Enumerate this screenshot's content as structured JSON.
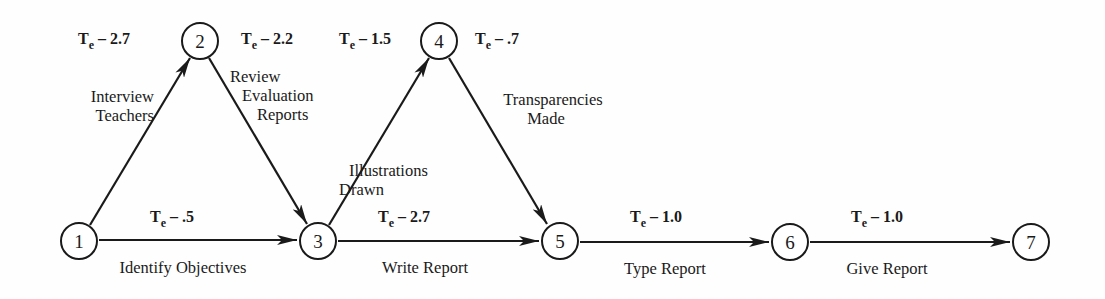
{
  "diagram": {
    "type": "PERT network",
    "nodes": [
      {
        "id": "1",
        "label": "1",
        "x": 79,
        "y": 241
      },
      {
        "id": "2",
        "label": "2",
        "x": 200,
        "y": 41
      },
      {
        "id": "3",
        "label": "3",
        "x": 318,
        "y": 241
      },
      {
        "id": "4",
        "label": "4",
        "x": 439,
        "y": 41
      },
      {
        "id": "5",
        "label": "5",
        "x": 560,
        "y": 241
      },
      {
        "id": "6",
        "label": "6",
        "x": 790,
        "y": 242
      },
      {
        "id": "7",
        "label": "7",
        "x": 1031,
        "y": 242
      }
    ],
    "edges": [
      {
        "from": "1",
        "to": "2",
        "activity": "Interview Teachers",
        "activity_lines": [
          "Interview",
          "Teachers"
        ],
        "te_symbol": "T",
        "te_sub": "e",
        "te_value": "– 2.7"
      },
      {
        "from": "2",
        "to": "3",
        "activity": "Review Evaluation Reports",
        "activity_lines": [
          "Review",
          "Evaluation",
          "Reports"
        ],
        "te_symbol": "T",
        "te_sub": "e",
        "te_value": "– 2.2"
      },
      {
        "from": "1",
        "to": "3",
        "activity": "Identify Objectives",
        "activity_lines": [
          "Identify Objectives"
        ],
        "te_symbol": "T",
        "te_sub": "e",
        "te_value": "– .5"
      },
      {
        "from": "3",
        "to": "4",
        "activity": "Illustrations Drawn",
        "activity_lines": [
          "Illustrations",
          "Drawn"
        ],
        "te_symbol": "T",
        "te_sub": "e",
        "te_value": "– 1.5"
      },
      {
        "from": "4",
        "to": "5",
        "activity": "Transparencies Made",
        "activity_lines": [
          "Transparencies",
          "Made"
        ],
        "te_symbol": "T",
        "te_sub": "e",
        "te_value": "– .7"
      },
      {
        "from": "3",
        "to": "5",
        "activity": "Write Report",
        "activity_lines": [
          "Write Report"
        ],
        "te_symbol": "T",
        "te_sub": "e",
        "te_value": "– 2.7"
      },
      {
        "from": "5",
        "to": "6",
        "activity": "Type Report",
        "activity_lines": [
          "Type Report"
        ],
        "te_symbol": "T",
        "te_sub": "e",
        "te_value": "– 1.0"
      },
      {
        "from": "6",
        "to": "7",
        "activity": "Give Report",
        "activity_lines": [
          "Give Report"
        ],
        "te_symbol": "T",
        "te_sub": "e",
        "te_value": "– 1.0"
      }
    ],
    "colors": {
      "ink": "#1a1a1a",
      "background": "#fefefe"
    }
  }
}
